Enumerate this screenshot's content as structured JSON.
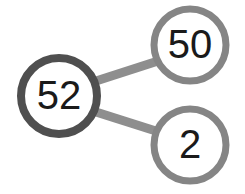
{
  "diagram": {
    "type": "number-bond",
    "background_color": "#ffffff",
    "whole": {
      "value": "52",
      "cx": 59,
      "cy": 96,
      "r": 38,
      "stroke_width": 8,
      "stroke_color": "#4f4f4f",
      "fill_color": "#ffffff",
      "font_size": 40
    },
    "parts": [
      {
        "name": "part-top",
        "value": "50",
        "cx": 190,
        "cy": 45,
        "r": 36,
        "stroke_width": 7,
        "stroke_color": "#858585",
        "fill_color": "#ffffff",
        "font_size": 40
      },
      {
        "name": "part-bottom",
        "value": "2",
        "cx": 190,
        "cy": 145,
        "r": 36,
        "stroke_width": 7,
        "stroke_color": "#858585",
        "fill_color": "#ffffff",
        "font_size": 40
      }
    ],
    "connectors": [
      {
        "name": "connector-whole-to-50",
        "x1": 96,
        "y1": 81,
        "x2": 158,
        "y2": 61,
        "stroke_width": 9,
        "stroke_color": "#8e8e8e"
      },
      {
        "name": "connector-whole-to-2",
        "x1": 96,
        "y1": 112,
        "x2": 159,
        "y2": 132,
        "stroke_width": 9,
        "stroke_color": "#8e8e8e"
      }
    ]
  }
}
